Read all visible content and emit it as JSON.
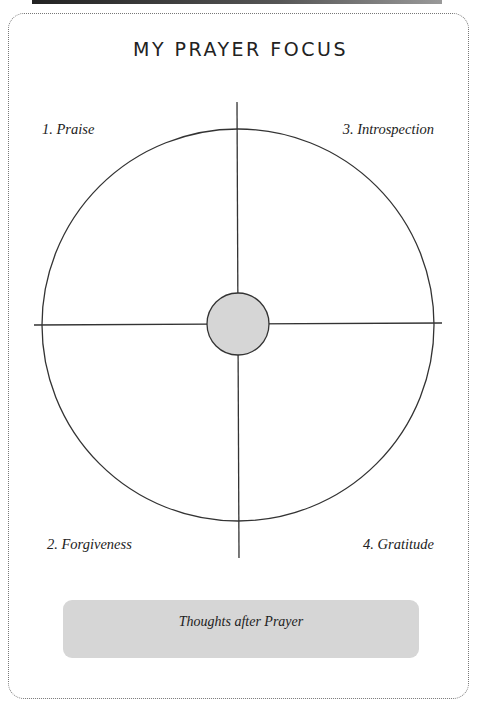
{
  "page": {
    "title": "MY PRAYER FOCUS"
  },
  "quadrants": [
    {
      "label": "1. Praise",
      "position": "top-left"
    },
    {
      "label": "2. Forgiveness",
      "position": "bottom-left"
    },
    {
      "label": "3. Introspection",
      "position": "top-right"
    },
    {
      "label": "4. Gratitude",
      "position": "bottom-right"
    }
  ],
  "thoughts_box": {
    "label": "Thoughts after Prayer"
  },
  "colors": {
    "line": "#333333",
    "center_fill": "#d6d6d6",
    "box_fill": "#d6d6d6",
    "border": "#777777"
  }
}
